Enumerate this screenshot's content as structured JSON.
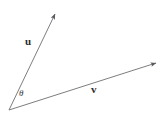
{
  "figure": {
    "background_color": "#ffffff",
    "stroke_color": "#6e6e73",
    "label_color": "#2b2b2b",
    "width": 165,
    "height": 114
  },
  "labels": {
    "vector_u": "u",
    "vector_v": "v",
    "angle": "θ"
  },
  "geometry": {
    "origin": {
      "x": 9,
      "y": 110
    },
    "vector_u_tip": {
      "x": 57,
      "y": 11
    },
    "vector_v_tip": {
      "x": 159,
      "y": 62
    },
    "arrowhead_color": "#5a5a5f"
  }
}
